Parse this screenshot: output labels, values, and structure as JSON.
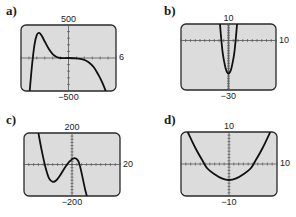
{
  "chart_data": [
    {
      "id": "a",
      "label": "a)",
      "type": "line",
      "title": "",
      "xlim": [
        -6,
        6
      ],
      "ylim": [
        -500,
        500
      ],
      "tick_labels": {
        "top": "500",
        "bottom": "−500",
        "left": "−6",
        "right": "6"
      },
      "x_ticks": 12,
      "y_ticks": 10,
      "grid": false,
      "description": "Degree-5 polynomial: rises steeply from bottom near x=-4.9, local max ~380 at x≈-3.8, flattens to ~0 from x≈-1 to x≈1, then falls steeply to bottom near x=5",
      "points": [
        [
          -4.9,
          -500
        ],
        [
          -4.6,
          -100
        ],
        [
          -4.3,
          200
        ],
        [
          -4.0,
          350
        ],
        [
          -3.7,
          380
        ],
        [
          -3.4,
          340
        ],
        [
          -3.0,
          250
        ],
        [
          -2.5,
          140
        ],
        [
          -2.0,
          60
        ],
        [
          -1.5,
          15
        ],
        [
          -1.0,
          0
        ],
        [
          0,
          0
        ],
        [
          1.0,
          -5
        ],
        [
          1.8,
          -20
        ],
        [
          2.5,
          -60
        ],
        [
          3.2,
          -140
        ],
        [
          3.8,
          -260
        ],
        [
          4.3,
          -380
        ],
        [
          4.7,
          -500
        ]
      ],
      "box": {
        "x": 21,
        "y": 25,
        "w": 95,
        "h": 66
      }
    },
    {
      "id": "b",
      "label": "b)",
      "type": "line",
      "title": "",
      "xlim": [
        -10,
        10
      ],
      "ylim": [
        -30,
        10
      ],
      "tick_labels": {
        "top": "10",
        "bottom": "−30",
        "left": "−10",
        "right": "10"
      },
      "x_ticks": 20,
      "y_ticks": 40,
      "grid": false,
      "description": "Narrow upward parabola with vertex near (0,-20), crossing y=10 at about x=±1.7",
      "points": [
        [
          -1.8,
          10
        ],
        [
          -1.5,
          0
        ],
        [
          -1.2,
          -8
        ],
        [
          -0.9,
          -13
        ],
        [
          -0.6,
          -17
        ],
        [
          -0.3,
          -19.2
        ],
        [
          0,
          -20
        ],
        [
          0.3,
          -19.2
        ],
        [
          0.6,
          -17
        ],
        [
          0.9,
          -13
        ],
        [
          1.2,
          -8
        ],
        [
          1.5,
          0
        ],
        [
          1.8,
          10
        ]
      ],
      "box": {
        "x": 181,
        "y": 24,
        "w": 95,
        "h": 66
      }
    },
    {
      "id": "c",
      "label": "c)",
      "type": "line",
      "title": "",
      "xlim": [
        -20,
        20
      ],
      "ylim": [
        -200,
        200
      ],
      "tick_labels": {
        "top": "200",
        "bottom": "−200",
        "left": "−20",
        "right": "20"
      },
      "x_ticks": 20,
      "y_ticks": 20,
      "grid": false,
      "description": "Decreasing cubic: from top near x=-14, local min ~-110 at x≈-8, local max ~40 at x≈1, falling to bottom near x=6",
      "points": [
        [
          -14,
          200
        ],
        [
          -12.5,
          80
        ],
        [
          -11,
          -20
        ],
        [
          -9.5,
          -90
        ],
        [
          -8,
          -110
        ],
        [
          -6.5,
          -100
        ],
        [
          -5,
          -70
        ],
        [
          -3,
          -20
        ],
        [
          -1,
          20
        ],
        [
          1,
          40
        ],
        [
          2.5,
          25
        ],
        [
          3.5,
          -20
        ],
        [
          4.5,
          -90
        ],
        [
          5.5,
          -160
        ],
        [
          6.2,
          -200
        ]
      ],
      "box": {
        "x": 24,
        "y": 133,
        "w": 96,
        "h": 63
      }
    },
    {
      "id": "d",
      "label": "d)",
      "type": "line",
      "title": "",
      "xlim": [
        -10,
        10
      ],
      "ylim": [
        -10,
        10
      ],
      "tick_labels": {
        "top": "10",
        "bottom": "−10",
        "left": "−10",
        "right": "10"
      },
      "x_ticks": 20,
      "y_ticks": 20,
      "grid": false,
      "description": "Wide upward parabola with vertex near (0,-5), x-intercepts near ±5, reaching y=10 near x=±8.5",
      "points": [
        [
          -8.6,
          10
        ],
        [
          -7,
          5
        ],
        [
          -5.5,
          1
        ],
        [
          -4.5,
          -1.4
        ],
        [
          -3,
          -3.2
        ],
        [
          -1.5,
          -4.5
        ],
        [
          0,
          -5
        ],
        [
          1.5,
          -4.5
        ],
        [
          3,
          -3.2
        ],
        [
          4.5,
          -1.4
        ],
        [
          5.5,
          1
        ],
        [
          7,
          5
        ],
        [
          8.6,
          10
        ]
      ],
      "box": {
        "x": 181,
        "y": 132,
        "w": 96,
        "h": 64
      }
    }
  ],
  "colors": {
    "screen_fill": "#dcdcdc",
    "frame": "#2a2a2a",
    "curve": "#111111",
    "axis": "#555555"
  }
}
